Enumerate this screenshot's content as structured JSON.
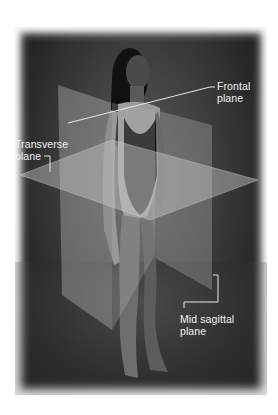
{
  "figure": {
    "colors": {
      "background": "#2b2b2b",
      "plane_fill": "#b8b8b8",
      "label_text": "#f2f2f2",
      "leader_line": "#e8e8e8"
    }
  },
  "labels": {
    "frontal": {
      "line1": "Frontal",
      "line2": "plane"
    },
    "transverse": {
      "line1": "Transverse",
      "line2": "plane"
    },
    "mid_sagittal": {
      "line1": "Mid sagittal",
      "line2": "plane"
    }
  }
}
